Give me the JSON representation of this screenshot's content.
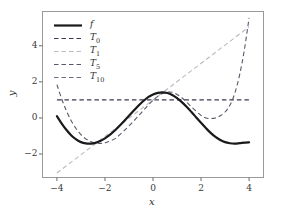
{
  "chart_data": {
    "type": "line",
    "title": "",
    "xlabel": "x",
    "ylabel": "y",
    "xlim": [
      -4.6,
      4.6
    ],
    "ylim": [
      -3.3,
      5.9
    ],
    "xticks": [
      -4,
      -2,
      0,
      2,
      4
    ],
    "xtick_labels": [
      "−4",
      "−2",
      "0",
      "2",
      "4"
    ],
    "yticks": [
      -2,
      0,
      2,
      4
    ],
    "ytick_labels": [
      "−2",
      "0",
      "2",
      "4"
    ],
    "grid": false,
    "legend_position": "upper left",
    "series": [
      {
        "name": "f",
        "label": "f",
        "color": "#1a1a1a",
        "linestyle": "solid",
        "linewidth": 2.2,
        "x": [
          -4.0,
          -3.8,
          -3.6,
          -3.4,
          -3.2,
          -3.0,
          -2.8,
          -2.6,
          -2.4,
          -2.2,
          -2.0,
          -1.8,
          -1.6,
          -1.4,
          -1.2,
          -1.0,
          -0.8,
          -0.6,
          -0.4,
          -0.2,
          0.0,
          0.2,
          0.4,
          0.6,
          0.8,
          1.0,
          1.2,
          1.4,
          1.6,
          1.8,
          2.0,
          2.2,
          2.4,
          2.6,
          2.8,
          3.0,
          3.2,
          3.4,
          3.6,
          3.8,
          4.0
        ],
        "y": [
          0.1,
          -0.31,
          -0.67,
          -0.97,
          -1.19,
          -1.34,
          -1.41,
          -1.42,
          -1.38,
          -1.28,
          -1.13,
          -0.94,
          -0.71,
          -0.45,
          -0.17,
          0.12,
          0.41,
          0.69,
          0.94,
          1.15,
          1.3,
          1.39,
          1.42,
          1.38,
          1.27,
          1.1,
          0.88,
          0.62,
          0.33,
          0.03,
          -0.27,
          -0.56,
          -0.83,
          -1.05,
          -1.22,
          -1.34,
          -1.4,
          -1.42,
          -1.4,
          -1.37,
          -1.35
        ]
      },
      {
        "name": "T0",
        "label": "T",
        "sublabel": "0",
        "color": "#3a3a4d",
        "linestyle": "dashed",
        "linewidth": 1.1,
        "description": "constant approximation y = 1",
        "x": [
          -4.0,
          4.0
        ],
        "y": [
          1.0,
          1.0
        ]
      },
      {
        "name": "T1",
        "label": "T",
        "sublabel": "1",
        "color": "#b9b9c4",
        "linestyle": "dashed",
        "linewidth": 1.1,
        "description": "linear approximation",
        "x": [
          -4.0,
          4.0
        ],
        "y": [
          -3.05,
          5.05
        ]
      },
      {
        "name": "T5",
        "label": "T",
        "sublabel": "5",
        "color": "#57576b",
        "linestyle": "dashed",
        "linewidth": 1.1,
        "description": "degree-5 Taylor polynomial, diverges at both ends",
        "x": [
          -4.0,
          -3.8,
          -3.6,
          -3.4,
          -3.2,
          -3.0,
          -2.8,
          -2.6,
          -2.4,
          -2.2,
          -2.0,
          -1.6,
          -1.2,
          -0.8,
          -0.4,
          0.0,
          0.4,
          0.8,
          1.2,
          1.6,
          2.0,
          2.2,
          2.4,
          2.6,
          2.8,
          3.0,
          3.2,
          3.4,
          3.6,
          3.8,
          4.0
        ],
        "y": [
          1.85,
          1.05,
          0.38,
          -0.17,
          -0.6,
          -0.93,
          -1.16,
          -1.31,
          -1.39,
          -1.41,
          -1.38,
          -1.16,
          -0.7,
          -0.17,
          0.42,
          0.98,
          1.36,
          1.42,
          1.12,
          0.62,
          0.14,
          0.0,
          -0.03,
          0.0,
          0.12,
          0.33,
          0.7,
          1.35,
          2.35,
          3.75,
          5.55
        ]
      },
      {
        "name": "T10",
        "label": "T",
        "sublabel": "10",
        "color": "#6c6c80",
        "linestyle": "dashed",
        "linewidth": 1.1,
        "description": "degree-10 Taylor polynomial, matches f across the window",
        "x": [
          -4.0,
          -3.6,
          -3.2,
          -2.8,
          -2.4,
          -2.0,
          -1.6,
          -1.2,
          -0.8,
          -0.4,
          0.0,
          0.4,
          0.8,
          1.2,
          1.6,
          2.0,
          2.4,
          2.8,
          3.2,
          3.6,
          4.0
        ],
        "y": [
          0.1,
          -0.67,
          -1.19,
          -1.41,
          -1.38,
          -1.13,
          -0.71,
          -0.17,
          0.41,
          0.94,
          1.3,
          1.42,
          1.27,
          0.88,
          0.33,
          -0.27,
          -0.83,
          -1.22,
          -1.4,
          -1.4,
          -1.35
        ]
      }
    ]
  },
  "axes": {
    "frame_color": "#9a9a9a",
    "background": "#ffffff",
    "tick_color": "#6a6a6a"
  }
}
